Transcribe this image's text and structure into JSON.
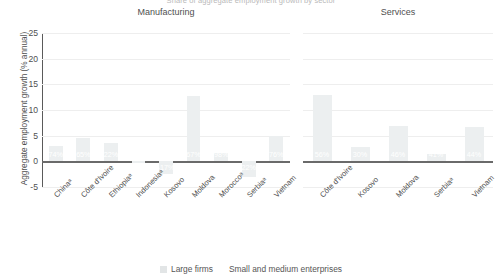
{
  "supertitle": "Share of aggregate employment growth by sector",
  "legend": {
    "items": [
      {
        "label": "Large firms",
        "color": "#e2e5e6",
        "has_swatch": true
      },
      {
        "label": "Small and medium enterprises",
        "color": "#e2e5e6",
        "has_swatch": false
      }
    ]
  },
  "chart_data": {
    "type": "bar",
    "title": "Share of aggregate employment growth by sector",
    "ylabel": "Aggregate employment growth (% annual)",
    "xlabel": "",
    "ylim": [
      -5,
      25
    ],
    "yticks": [
      25,
      20,
      15,
      10,
      5,
      0,
      -5
    ],
    "ytick_labels": [
      "25",
      "20",
      "15",
      "10",
      "5",
      "0",
      "-5"
    ],
    "grid": true,
    "legend_position": "bottom",
    "bar_color": "#eceff0",
    "label_color": "#ffffff",
    "panels": [
      {
        "name": "Manufacturing",
        "categories": [
          "Chinaᵃ",
          "Côte d'Ivoire",
          "Ethiopiaᵃ",
          "Indonesiaᵃ",
          "Kosovo",
          "Moldova",
          "Moroccoᵃ",
          "Serbiaᵃ",
          "Vietnam"
        ],
        "values": [
          3.0,
          4.6,
          3.6,
          -0.4,
          -2.4,
          12.8,
          1.6,
          -3.1,
          4.9
        ],
        "data_labels": [
          "74%",
          "65%",
          "22%",
          "",
          "-17%",
          "67%",
          "98%",
          "22%",
          "76%"
        ]
      },
      {
        "name": "Services",
        "categories": [
          "Côte d'Ivoire",
          "Kosovo",
          "Moldova",
          "Serbiaᵃ",
          "Vietnam"
        ],
        "values": [
          12.9,
          2.8,
          6.8,
          1.4,
          6.6
        ],
        "data_labels": [
          "56%",
          "30%",
          "46%",
          "41%",
          "44%"
        ]
      }
    ]
  }
}
